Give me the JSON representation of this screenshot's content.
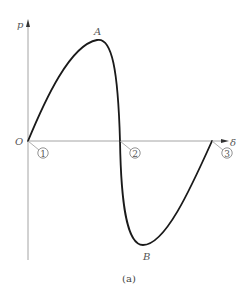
{
  "diagram": {
    "axes": {
      "y_label": "p",
      "x_label": "δ",
      "origin_label": "O"
    },
    "points": {
      "peak_label": "A",
      "trough_label": "B"
    },
    "markers": [
      "1",
      "2",
      "3"
    ],
    "caption": "(a)",
    "colors": {
      "curve": "#1a1a1a",
      "axis": "#999999",
      "text": "#555555"
    }
  }
}
